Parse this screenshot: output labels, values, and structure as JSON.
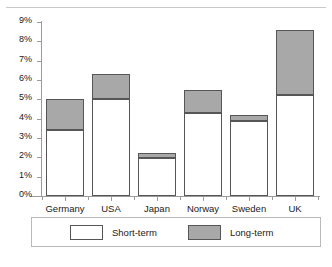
{
  "page": {
    "header_partial_text": "",
    "background_color": "#ffffff"
  },
  "colors": {
    "short_term_fill": "#ffffff",
    "long_term_fill": "#a8a8a8",
    "bar_border": "#565656",
    "axis": "#9b9b9b",
    "text": "#1a1a1a"
  },
  "chart_data": {
    "type": "bar",
    "title": "",
    "subtitle": "",
    "xlabel": "",
    "ylabel": "",
    "stacked": true,
    "grid": false,
    "legend_position": "bottom",
    "ylim": [
      0,
      9
    ],
    "ytick_labels": [
      "9%",
      "8%",
      "7%",
      "6%",
      "5%",
      "4%",
      "3%",
      "2%",
      "1%",
      "0%"
    ],
    "ytick_values": [
      9,
      8,
      7,
      6,
      5,
      4,
      3,
      2,
      1,
      0
    ],
    "categories": [
      "Germany",
      "USA",
      "Japan",
      "Norway",
      "Sweden",
      "UK"
    ],
    "series": [
      {
        "name": "Short-term",
        "fill": "#ffffff",
        "values": [
          3.4,
          5.0,
          1.95,
          4.3,
          3.9,
          5.2
        ]
      },
      {
        "name": "Long-term",
        "fill": "#a8a8a8",
        "values": [
          1.6,
          1.3,
          0.25,
          1.2,
          0.3,
          3.4
        ]
      }
    ],
    "totals": [
      5.0,
      6.3,
      2.2,
      5.5,
      4.2,
      8.6
    ],
    "value_unit": "%"
  },
  "legend": {
    "entries": [
      {
        "label": "Short-term",
        "swatch": "white-square"
      },
      {
        "label": "Long-term",
        "swatch": "gray-square"
      }
    ]
  }
}
